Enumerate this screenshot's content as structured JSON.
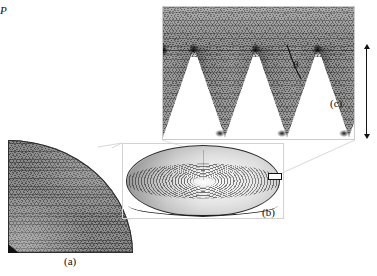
{
  "figure": {
    "type": "scientific-figure",
    "background_color": "#ffffff"
  },
  "panels": [
    {
      "id": "a",
      "label": "(a)",
      "name": "quarter-disc-mesh",
      "description": "Quarter-symmetry triangular finite element mesh of the disc",
      "shape": "quarter-circle",
      "mesh_color": "#8c8c8c",
      "edge_color": "#2c2c2c"
    },
    {
      "id": "b",
      "label": "(b)",
      "name": "full-disc-3d-view",
      "description": "Three dimensional view of the full disc showing concentric circular grooves",
      "shape": "ellipse",
      "groove_pattern": "concentric-rings",
      "frame_color": "#d2d2d2"
    },
    {
      "id": "c",
      "label": "(c)",
      "name": "groove-cross-section-detail",
      "description": "Magnified cross-section of the V-shaped grooves showing mesh refinement at the tips",
      "tooth_shape": "triangular-v-groove",
      "tooth_count": 3,
      "mesh_color": "#8f8f8f",
      "frame_color": "#cccccc"
    }
  ],
  "annotations": {
    "theta": {
      "symbol": "θ",
      "name": "groove-half-angle",
      "panel": "c"
    },
    "pitch": {
      "symbol": "P",
      "name": "groove-depth-pitch",
      "panel": "c"
    }
  },
  "callout": {
    "name": "detail-region-box",
    "from_panel": "b",
    "to_panel": "c",
    "border_color": "#101010"
  },
  "connectors": [
    {
      "name": "connector-a-to-b",
      "color": "#d8d8d8"
    },
    {
      "name": "connector-b-to-c",
      "color": "#d8d8d8"
    }
  ]
}
